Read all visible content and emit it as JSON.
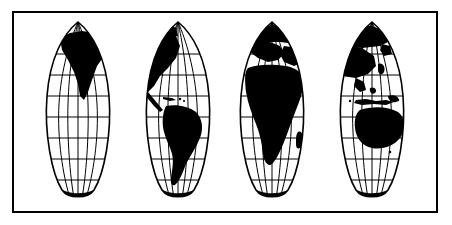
{
  "figure": {
    "style": "black-and-white line art / clipart",
    "background_color": "#ffffff",
    "ink_color": "#000000",
    "land_fill": "#000000",
    "ocean_fill": "#ffffff",
    "graticule_color": "#000000"
  },
  "frame": {
    "name": "outer-border",
    "x": 13,
    "y": 12,
    "width": 424,
    "height": 200,
    "stroke_width": 2,
    "stroke_color": "#000000",
    "fill": "#ffffff"
  },
  "projection": {
    "type": "interrupted-sinusoidal",
    "lobe_count": 4,
    "interrupted": true,
    "north_pole_converges": true,
    "south_pole_converges": true,
    "lobes": [
      {
        "id": "lobe-1",
        "label": "North & South America (west)",
        "center_x": 78,
        "half_width": 55,
        "landmasses": [
          "North America (west)",
          "Greenland (west)",
          "Antarctica (segment)"
        ]
      },
      {
        "id": "lobe-2",
        "label": "Americas (east)",
        "center_x": 178,
        "half_width": 55,
        "landmasses": [
          "North America (east)",
          "South America",
          "Caribbean",
          "Antarctica (segment)"
        ]
      },
      {
        "id": "lobe-3",
        "label": "Europe & Africa",
        "center_x": 272,
        "half_width": 55,
        "landmasses": [
          "Europe",
          "Africa",
          "Madagascar",
          "Western Asia",
          "Antarctica (segment)"
        ]
      },
      {
        "id": "lobe-4",
        "label": "Asia & Australia",
        "center_x": 372,
        "half_width": 55,
        "landmasses": [
          "East Asia",
          "Southeast Asia",
          "Indonesia",
          "Australia",
          "New Zealand",
          "Antarctica (segment)"
        ]
      }
    ],
    "graticule": {
      "parallels_interval_deg": 15,
      "meridians_per_lobe": 5,
      "parallel_rows_px": [
        54,
        75,
        96,
        117,
        138,
        159,
        180
      ],
      "equator_row_px": 117,
      "top_px": 22,
      "bottom_px": 202
    }
  },
  "labels": {
    "none_visible": true
  }
}
